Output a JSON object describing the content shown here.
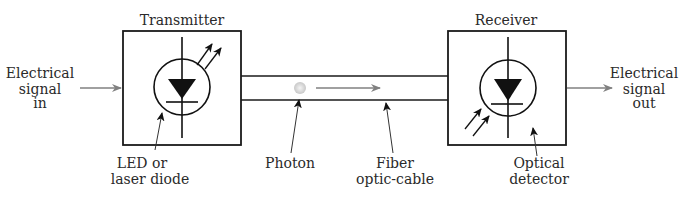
{
  "diagram": {
    "colors": {
      "stroke": "#1a1a1a",
      "signal_arrow": "#808080",
      "photon": "#d0d0d0",
      "text": "#2a2a2a"
    },
    "transmitter": {
      "label": "Transmitter",
      "component_label_line1": "LED or",
      "component_label_line2": "laser diode",
      "icon": "led-diode-emitting-icon"
    },
    "receiver": {
      "label": "Receiver",
      "component_label_line1": "Optical",
      "component_label_line2": "detector",
      "icon": "photodiode-receiving-icon"
    },
    "input": {
      "line1": "Electrical",
      "line2": "signal",
      "line3": "in"
    },
    "output": {
      "line1": "Electrical",
      "line2": "signal",
      "line3": "out"
    },
    "photon": {
      "label": "Photon"
    },
    "fiber": {
      "label_line1": "Fiber",
      "label_line2": "optic-cable"
    }
  }
}
